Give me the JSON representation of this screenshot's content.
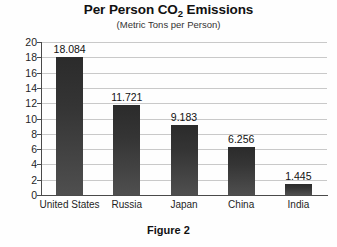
{
  "chart_data": {
    "type": "bar",
    "title": "Per Person CO2 Emissions",
    "title_main": "Per Person CO",
    "title_sub": "2",
    "title_tail": " Emissions",
    "subtitle": "(Metric Tons per Person)",
    "caption": "Figure 2",
    "categories": [
      "United States",
      "Russia",
      "Japan",
      "China",
      "India"
    ],
    "values": [
      18.084,
      11.721,
      9.183,
      6.256,
      1.445
    ],
    "value_labels": [
      "18.084",
      "11.721",
      "9.183",
      "6.256",
      "1.445"
    ],
    "xlabel": "",
    "ylabel": "",
    "ylim": [
      0,
      20
    ],
    "ytick_labels": [
      "20",
      "18",
      "16",
      "14",
      "12",
      "10",
      "8",
      "6",
      "4",
      "2",
      "0"
    ],
    "ytick_values": [
      20,
      18,
      16,
      14,
      12,
      10,
      8,
      6,
      4,
      2,
      0
    ],
    "grid": true,
    "legend": "none",
    "colors": {
      "bar": "#343434",
      "gridline": "#c9c9c9",
      "axis": "#4a4a4a",
      "background": "#fefefe",
      "text": "#111111"
    }
  }
}
